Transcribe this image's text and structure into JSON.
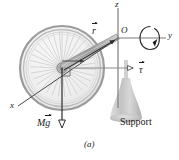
{
  "figure": {
    "caption": "(a)",
    "axes": {
      "z_label": "z",
      "y_label": "y",
      "x_label": "x",
      "origin_label": "O"
    },
    "vectors": {
      "r_label": "r",
      "tau_label": "τ",
      "weight_label_m": "M",
      "weight_label_g": "g"
    },
    "support_label": "Support",
    "colors": {
      "background": "#ffffff",
      "ink": "#1a1a1a",
      "axis_gray": "#8c8c8c",
      "wheel_rim": "#b9b9b9",
      "wheel_rim_dark": "#8f8f8f",
      "spoke": "#cfcfcf",
      "hub": "#a8a8a8",
      "axle_shaft": "#a5a5a5",
      "support_fill": "#c8c8c8",
      "support_shadow": "#b0b0b0"
    },
    "geometry": {
      "origin_x": 118,
      "origin_y": 38,
      "hub_x": 62,
      "hub_y": 68,
      "wheel_radius": 42,
      "z_top_y": 6,
      "y_end_x": 170,
      "x_end_x": 14,
      "x_end_y": 108
    }
  }
}
